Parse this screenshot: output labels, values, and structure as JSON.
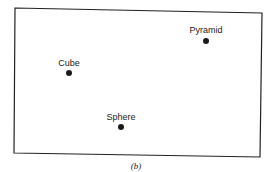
{
  "diagram": {
    "type": "point-space",
    "frame": {
      "corners": [
        [
          15,
          8
        ],
        [
          262,
          13
        ],
        [
          260,
          157
        ],
        [
          14,
          153
        ]
      ],
      "stroke": "#222222"
    },
    "points": [
      {
        "label": "Pyramid",
        "x": 206,
        "y": 41
      },
      {
        "label": "Cube",
        "x": 69,
        "y": 73
      },
      {
        "label": "Sphere",
        "x": 121,
        "y": 127
      }
    ],
    "caption": "(b)"
  }
}
